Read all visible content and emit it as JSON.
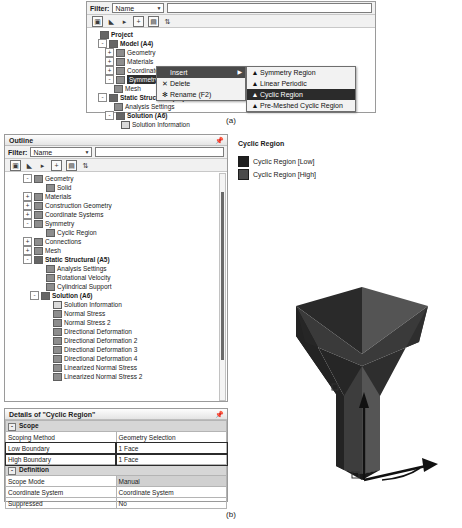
{
  "figure": {
    "caption_a": "(a)",
    "caption_b": "(b)"
  },
  "panel_a": {
    "filter": {
      "label": "Filter:",
      "selected": "Name",
      "options": [
        "Name",
        "Tag",
        "Type"
      ],
      "search_value": "",
      "search_placeholder": ""
    },
    "toolbar_icons": [
      "show-hide-icon",
      "expand-icon",
      "next-icon",
      "expand-all-icon",
      "collapse-icon",
      "sort-icon"
    ],
    "tree": [
      {
        "label": "Project",
        "indent": 0,
        "expander": "",
        "bold": true,
        "icon": "project-icon"
      },
      {
        "label": "Model (A4)",
        "indent": 1,
        "expander": "-",
        "bold": true,
        "icon": "model-icon"
      },
      {
        "label": "Geometry",
        "indent": 2,
        "expander": "+",
        "bold": false,
        "icon": "geometry-icon"
      },
      {
        "label": "Materials",
        "indent": 2,
        "expander": "+",
        "bold": false,
        "icon": "materials-icon"
      },
      {
        "label": "Coordinate Systems",
        "indent": 2,
        "expander": "+",
        "bold": false,
        "icon": "coordinate-systems-icon"
      },
      {
        "label": "Symmetry",
        "indent": 2,
        "expander": "-",
        "bold": false,
        "icon": "symmetry-icon",
        "selected": true
      },
      {
        "label": "Mesh",
        "indent": 2,
        "expander": "",
        "bold": false,
        "icon": "mesh-icon"
      },
      {
        "label": "Static Structural (A5)",
        "indent": 1,
        "expander": "-",
        "bold": true,
        "icon": "static-structural-icon"
      },
      {
        "label": "Analysis Settings",
        "indent": 2,
        "expander": "",
        "bold": false,
        "icon": "analysis-settings-icon"
      },
      {
        "label": "Solution (A6)",
        "indent": 2,
        "expander": "-",
        "bold": true,
        "icon": "solution-icon"
      },
      {
        "label": "Solution Information",
        "indent": 3,
        "expander": "",
        "bold": false,
        "icon": "solution-information-icon"
      }
    ],
    "context_menu": [
      {
        "label": "Insert",
        "icon": "",
        "highlight": true,
        "has_submenu": true,
        "submenu_arrow": "▶"
      },
      {
        "label": "Delete",
        "icon": "delete-icon",
        "highlight": false,
        "has_submenu": false,
        "glyph": "✕"
      },
      {
        "label": "Rename (F2)",
        "icon": "rename-icon",
        "highlight": false,
        "has_submenu": false,
        "glyph": "✻"
      }
    ],
    "submenu": [
      {
        "label": "Symmetry Region",
        "icon": "symmetry-region-icon",
        "highlight": false
      },
      {
        "label": "Linear Periodic",
        "icon": "linear-periodic-icon",
        "highlight": false
      },
      {
        "label": "Cyclic Region",
        "icon": "cyclic-region-icon",
        "highlight": true
      },
      {
        "label": "Pre-Meshed Cyclic Region",
        "icon": "pre-meshed-cyclic-icon",
        "highlight": false
      }
    ]
  },
  "panel_b": {
    "outline": {
      "title": "Outline",
      "pin_icon": "pin-icon",
      "filter": {
        "label": "Filter:",
        "selected": "Name",
        "options": [
          "Name",
          "Tag",
          "Type"
        ],
        "search_value": ""
      },
      "toolbar_icons": [
        "show-hide-icon",
        "expand-icon",
        "next-icon",
        "expand-all-icon",
        "collapse-icon",
        "sort-icon"
      ],
      "tree": [
        {
          "label": "Geometry",
          "indent": 2,
          "expander": "-",
          "bold": false,
          "icon": "geometry-icon"
        },
        {
          "label": "Solid",
          "indent": 4,
          "expander": "",
          "bold": false,
          "icon": "solid-icon"
        },
        {
          "label": "Materials",
          "indent": 2,
          "expander": "+",
          "bold": false,
          "icon": "materials-icon"
        },
        {
          "label": "Construction Geometry",
          "indent": 2,
          "expander": "+",
          "bold": false,
          "icon": "construction-geometry-icon"
        },
        {
          "label": "Coordinate Systems",
          "indent": 2,
          "expander": "+",
          "bold": false,
          "icon": "coordinate-systems-icon"
        },
        {
          "label": "Symmetry",
          "indent": 2,
          "expander": "-",
          "bold": false,
          "icon": "symmetry-icon"
        },
        {
          "label": "Cyclic Region",
          "indent": 4,
          "expander": "",
          "bold": false,
          "icon": "cyclic-region-icon"
        },
        {
          "label": "Connections",
          "indent": 2,
          "expander": "+",
          "bold": false,
          "icon": "connections-icon"
        },
        {
          "label": "Mesh",
          "indent": 2,
          "expander": "+",
          "bold": false,
          "icon": "mesh-icon"
        },
        {
          "label": "Static Structural (A5)",
          "indent": 2,
          "expander": "-",
          "bold": true,
          "icon": "static-structural-icon"
        },
        {
          "label": "Analysis Settings",
          "indent": 4,
          "expander": "",
          "bold": false,
          "icon": "analysis-settings-icon"
        },
        {
          "label": "Rotational Velocity",
          "indent": 4,
          "expander": "",
          "bold": false,
          "icon": "rotational-velocity-icon"
        },
        {
          "label": "Cylindrical Support",
          "indent": 4,
          "expander": "",
          "bold": false,
          "icon": "cylindrical-support-icon"
        },
        {
          "label": "Solution (A6)",
          "indent": 3,
          "expander": "-",
          "bold": true,
          "icon": "solution-icon"
        },
        {
          "label": "Solution Information",
          "indent": 5,
          "expander": "",
          "bold": false,
          "icon": "solution-information-icon"
        },
        {
          "label": "Normal Stress",
          "indent": 5,
          "expander": "",
          "bold": false,
          "icon": "result-icon"
        },
        {
          "label": "Normal Stress 2",
          "indent": 5,
          "expander": "",
          "bold": false,
          "icon": "result-icon"
        },
        {
          "label": "Directional Deformation",
          "indent": 5,
          "expander": "",
          "bold": false,
          "icon": "result-icon"
        },
        {
          "label": "Directional Deformation 2",
          "indent": 5,
          "expander": "",
          "bold": false,
          "icon": "result-icon"
        },
        {
          "label": "Directional Deformation 3",
          "indent": 5,
          "expander": "",
          "bold": false,
          "icon": "result-icon"
        },
        {
          "label": "Directional Deformation 4",
          "indent": 5,
          "expander": "",
          "bold": false,
          "icon": "result-icon"
        },
        {
          "label": "Linearized Normal Stress",
          "indent": 5,
          "expander": "",
          "bold": false,
          "icon": "result-icon"
        },
        {
          "label": "Linearized Normal Stress 2",
          "indent": 5,
          "expander": "",
          "bold": false,
          "icon": "result-icon"
        }
      ]
    },
    "details": {
      "title": "Details of \"Cyclic Region\"",
      "pin_icon": "pin-icon",
      "rows": [
        {
          "type": "section",
          "label": "Scope"
        },
        {
          "type": "row",
          "key": "Scoping Method",
          "value": "Geometry Selection",
          "shaded": false,
          "boxed": false
        },
        {
          "type": "row",
          "key": "Low Boundary",
          "value": "1 Face",
          "shaded": false,
          "boxed": true
        },
        {
          "type": "row",
          "key": "High Boundary",
          "value": "1 Face",
          "shaded": false,
          "boxed": true
        },
        {
          "type": "section",
          "label": "Definition"
        },
        {
          "type": "row",
          "key": "Scope Mode",
          "value": "Manual",
          "shaded": true,
          "boxed": false
        },
        {
          "type": "row",
          "key": "Coordinate System",
          "value": "Coordinate System",
          "shaded": false,
          "boxed": false
        },
        {
          "type": "row",
          "key": "Suppressed",
          "value": "No",
          "shaded": false,
          "boxed": false
        }
      ]
    },
    "viewport": {
      "legend_title": "Cyclic Region",
      "legend_items": [
        {
          "label": "Cyclic Region  [Low]",
          "color": "#1f1f1f"
        },
        {
          "label": "Cyclic Region  [High]",
          "color": "#4a4a4a"
        }
      ],
      "model_name": "cyclic-sector-model",
      "triad_icon": "coordinate-triad-icon"
    }
  },
  "colors": {
    "selection_highlight": "#2f2f2f",
    "menu_highlight": "#4a4a4a",
    "panel_bg": "#f1f1f1",
    "border": "#9a9a9a"
  }
}
